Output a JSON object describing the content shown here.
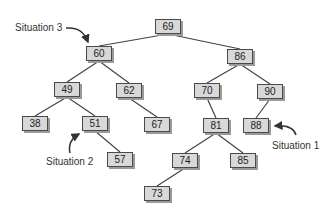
{
  "diagram": {
    "type": "binary-search-tree",
    "colors": {
      "node_fill": "#d8d8d8",
      "node_border": "#4a4a4a",
      "edge": "#444444",
      "text": "#222222"
    },
    "nodes": [
      {
        "id": "n69",
        "value": "69",
        "x": 155,
        "y": 19
      },
      {
        "id": "n60",
        "value": "60",
        "x": 86,
        "y": 46
      },
      {
        "id": "n86",
        "value": "86",
        "x": 227,
        "y": 49
      },
      {
        "id": "n49",
        "value": "49",
        "x": 54,
        "y": 82
      },
      {
        "id": "n62",
        "value": "62",
        "x": 116,
        "y": 83
      },
      {
        "id": "n70",
        "value": "70",
        "x": 194,
        "y": 83
      },
      {
        "id": "n90",
        "value": "90",
        "x": 257,
        "y": 84
      },
      {
        "id": "n38",
        "value": "38",
        "x": 22,
        "y": 116
      },
      {
        "id": "n51",
        "value": "51",
        "x": 82,
        "y": 116
      },
      {
        "id": "n67",
        "value": "67",
        "x": 144,
        "y": 117
      },
      {
        "id": "n81",
        "value": "81",
        "x": 203,
        "y": 118
      },
      {
        "id": "n88",
        "value": "88",
        "x": 243,
        "y": 118
      },
      {
        "id": "n57",
        "value": "57",
        "x": 107,
        "y": 152
      },
      {
        "id": "n74",
        "value": "74",
        "x": 172,
        "y": 153
      },
      {
        "id": "n85",
        "value": "85",
        "x": 230,
        "y": 153
      },
      {
        "id": "n73",
        "value": "73",
        "x": 144,
        "y": 186
      }
    ],
    "edges": [
      [
        "n69",
        "n60"
      ],
      [
        "n69",
        "n86"
      ],
      [
        "n60",
        "n49"
      ],
      [
        "n60",
        "n62"
      ],
      [
        "n86",
        "n70"
      ],
      [
        "n86",
        "n90"
      ],
      [
        "n49",
        "n38"
      ],
      [
        "n49",
        "n51"
      ],
      [
        "n62",
        "n67"
      ],
      [
        "n70",
        "n81"
      ],
      [
        "n90",
        "n88"
      ],
      [
        "n51",
        "n57"
      ],
      [
        "n81",
        "n74"
      ],
      [
        "n81",
        "n85"
      ],
      [
        "n74",
        "n73"
      ]
    ],
    "annotations": [
      {
        "id": "situation-1",
        "text": "Situation 1",
        "x": 272,
        "y": 138,
        "points_to": "n88"
      },
      {
        "id": "situation-2",
        "text": "Situation 2",
        "x": 46,
        "y": 156,
        "points_to": "n51"
      },
      {
        "id": "situation-3",
        "text": "Situation 3",
        "x": 15,
        "y": 27,
        "points_to": "n60"
      }
    ]
  }
}
